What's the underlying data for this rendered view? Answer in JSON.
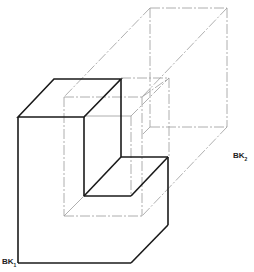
{
  "diagram": {
    "type": "isometric-projection",
    "labels": {
      "bk1": {
        "main": "BK",
        "sub": "1"
      },
      "bk2": {
        "main": "BK",
        "sub": "2"
      }
    },
    "colors": {
      "solid_edges": "#1a1a1a",
      "construction_lines": "#9a9a9a",
      "background": "#ffffff"
    }
  }
}
